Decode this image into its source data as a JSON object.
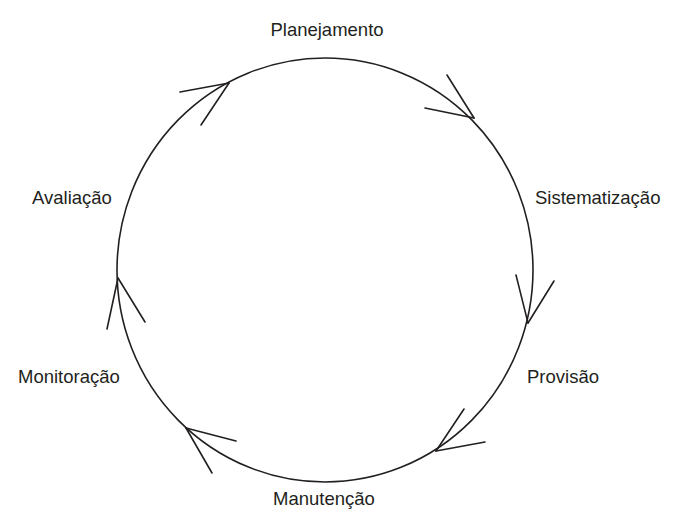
{
  "diagram": {
    "type": "cycle",
    "direction": "clockwise",
    "stroke_color": "#231f20",
    "background_color": "#ffffff",
    "stages": [
      {
        "id": "planejamento",
        "label": "Planejamento"
      },
      {
        "id": "sistematizacao",
        "label": "Sistematização"
      },
      {
        "id": "provisao",
        "label": "Provisão"
      },
      {
        "id": "manutencao",
        "label": "Manutenção"
      },
      {
        "id": "monitoracao",
        "label": "Monitoração"
      },
      {
        "id": "avaliacao",
        "label": "Avaliação"
      }
    ],
    "edges": [
      {
        "from": "avaliacao",
        "to": "planejamento"
      },
      {
        "from": "planejamento",
        "to": "sistematizacao"
      },
      {
        "from": "sistematizacao",
        "to": "provisao"
      },
      {
        "from": "provisao",
        "to": "manutencao"
      },
      {
        "from": "manutencao",
        "to": "monitoracao"
      },
      {
        "from": "monitoracao",
        "to": "avaliacao"
      }
    ]
  }
}
